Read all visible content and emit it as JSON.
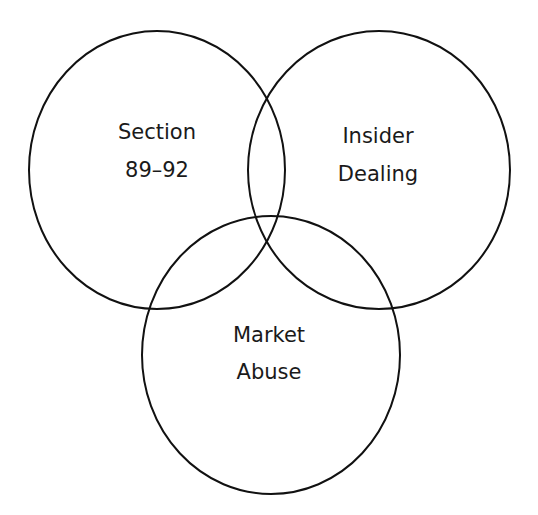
{
  "diagram": {
    "type": "venn",
    "sets": [
      {
        "id": "section",
        "lines": [
          "Section",
          "89–92"
        ]
      },
      {
        "id": "insider",
        "lines": [
          "Insider",
          "Dealing"
        ]
      },
      {
        "id": "market",
        "lines": [
          "Market",
          "Abuse"
        ]
      }
    ],
    "stroke_color": "#111111",
    "background": "#ffffff"
  }
}
